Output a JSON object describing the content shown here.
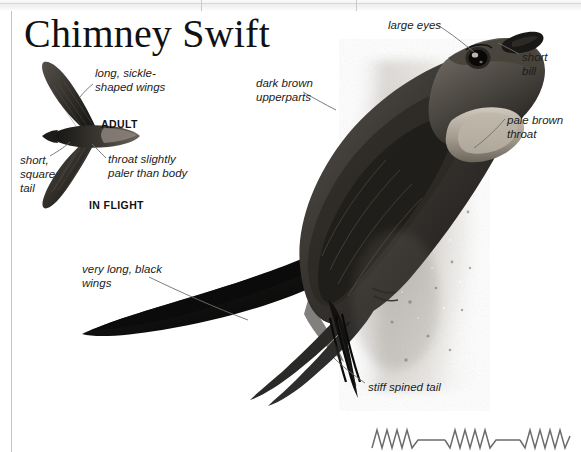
{
  "page": {
    "title": "Chimney Swift",
    "background_color": "#ffffff",
    "border_color": "#c4c4c4",
    "label_color": "#1c1c1c",
    "leader_color": "#6e6e6e"
  },
  "top_strip": {
    "name": "scanner-edge-strip",
    "color": "#eeeeee",
    "divider_color": "#c9c9c9"
  },
  "labels": [
    {
      "id": "long-sickle-shaped-wings",
      "text": "long, sickle-\nshaped wings",
      "x": 95,
      "y": 66
    },
    {
      "id": "dark-brown-upperparts",
      "text": "dark brown\nupperparts",
      "x": 256,
      "y": 76
    },
    {
      "id": "large-eyes",
      "text": "large eyes",
      "x": 388,
      "y": 18
    },
    {
      "id": "short-bill",
      "text": "short\nbill",
      "x": 522,
      "y": 50
    },
    {
      "id": "pale-brown-throat",
      "text": "pale brown\nthroat",
      "x": 507,
      "y": 113
    },
    {
      "id": "throat-slightly-paler",
      "text": "throat slightly\npaler than body",
      "x": 108,
      "y": 152
    },
    {
      "id": "short-square-tail",
      "text": "short,\nsquare\ntail",
      "x": 20,
      "y": 153
    },
    {
      "id": "very-long-black-wings",
      "text": "very long, black\nwings",
      "x": 82,
      "y": 262
    },
    {
      "id": "stiff-spined-tail",
      "text": "stiff spined tail",
      "x": 368,
      "y": 380
    }
  ],
  "captions": [
    {
      "id": "adult",
      "text": "ADULT",
      "x": 101,
      "y": 118
    },
    {
      "id": "in-flight",
      "text": "IN FLIGHT",
      "x": 89,
      "y": 199
    }
  ],
  "figures": {
    "flight_silhouette": {
      "name": "chimney-swift-flight-silhouette",
      "description": "Chimney Swift in flight, seen from below, swept sickle wings and short square tail"
    },
    "perched_photo": {
      "name": "chimney-swift-photograph",
      "description": "Chimney Swift clinging to a vertical chimney wall, dark brown plumage, pale throat"
    },
    "sonogram": {
      "name": "chimney-swift-sonogram",
      "description": "Song sonogram: three bursts of rapid zigzag chittering separated by flat lines",
      "color": "#6b6b6b",
      "bursts": 3,
      "zigzags_per_burst": [
        4,
        4,
        4
      ]
    }
  }
}
